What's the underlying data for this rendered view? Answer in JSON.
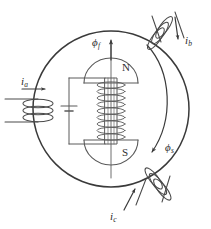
{
  "figure": {
    "type": "electrical-machine-diagram",
    "background_color": "#ffffff",
    "line_color": "#3a3a3a"
  },
  "stator": {
    "name": "stator-circle",
    "center_x": 111,
    "center_y": 109,
    "radius": 78
  },
  "rotor": {
    "north_pole_label": "N",
    "south_pole_label": "S",
    "shaft_label": "rotor-shaft",
    "field_winding_turns": 10,
    "battery_label": "dc-source"
  },
  "flux": {
    "field": {
      "symbol": "ϕ",
      "subscript": "f",
      "direction": "up",
      "description": "rotor field flux, vertical upward arrow"
    },
    "stator": {
      "symbol": "ϕ",
      "subscript": "s",
      "direction": "clockwise-arc",
      "description": "stator rotating flux, curved arrow"
    }
  },
  "phases": [
    {
      "id": "phase-a",
      "current_symbol": "i",
      "current_subscript": "a",
      "position": "left",
      "arrow_direction": "right",
      "coil_turns": 3
    },
    {
      "id": "phase-b",
      "current_symbol": "i",
      "current_subscript": "b",
      "position": "top-right",
      "arrow_direction": "down",
      "coil_turns": 3
    },
    {
      "id": "phase-c",
      "current_symbol": "i",
      "current_subscript": "c",
      "position": "bottom-right",
      "arrow_direction": "up-right",
      "coil_turns": 3
    }
  ]
}
